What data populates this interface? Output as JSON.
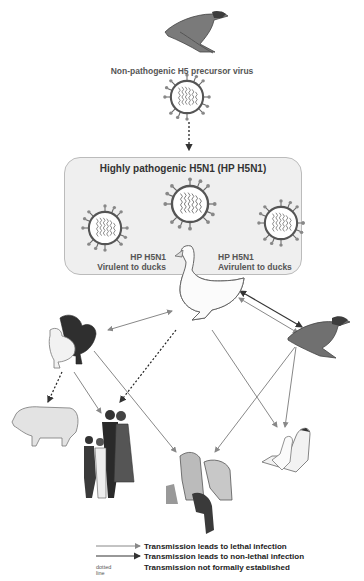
{
  "diagram": {
    "top_label": "Non-pathogenic H5 precursor virus",
    "box_title": "Highly pathogenic H5N1 (HP H5N1)",
    "virus_left": {
      "line1": "HP H5N1",
      "line2": "Virulent to ducks"
    },
    "virus_right": {
      "line1": "HP H5N1",
      "line2": "Avirulent to ducks"
    },
    "nodes": [
      {
        "id": "wild-duck-top",
        "name": "Wild duck (mallard)"
      },
      {
        "id": "precursor-virus",
        "name": "Non-pathogenic H5 precursor virus"
      },
      {
        "id": "hp-virus-center",
        "name": "HP H5N1 virus"
      },
      {
        "id": "hp-virus-left",
        "name": "HP H5N1 virulent to ducks"
      },
      {
        "id": "hp-virus-right",
        "name": "HP H5N1 avirulent to ducks"
      },
      {
        "id": "domestic-duck",
        "name": "Domestic duck"
      },
      {
        "id": "chickens",
        "name": "Chickens"
      },
      {
        "id": "wild-duck-right",
        "name": "Wild duck (mallard)"
      },
      {
        "id": "pig",
        "name": "Pig"
      },
      {
        "id": "humans",
        "name": "Human family"
      },
      {
        "id": "felines-ferret",
        "name": "Tigers, leopard, cat, ferret"
      },
      {
        "id": "geese",
        "name": "Geese"
      }
    ],
    "edges": [
      {
        "from": "precursor-virus",
        "to": "hp-virus-center",
        "type": "dotted"
      },
      {
        "from": "domestic-duck",
        "to": "chickens",
        "type": "lethal",
        "bidirectional": true
      },
      {
        "from": "domestic-duck",
        "to": "wild-duck-right",
        "type": "non-lethal",
        "bidirectional": true
      },
      {
        "from": "domestic-duck",
        "to": "wild-duck-right",
        "type": "lethal",
        "bidirectional": true
      },
      {
        "from": "domestic-duck",
        "to": "humans",
        "type": "dotted"
      },
      {
        "from": "domestic-duck",
        "to": "geese",
        "type": "lethal"
      },
      {
        "from": "chickens",
        "to": "pig",
        "type": "dotted"
      },
      {
        "from": "chickens",
        "to": "humans",
        "type": "lethal"
      },
      {
        "from": "chickens",
        "to": "felines-ferret",
        "type": "lethal"
      },
      {
        "from": "wild-duck-right",
        "to": "felines-ferret",
        "type": "lethal"
      },
      {
        "from": "wild-duck-right",
        "to": "geese",
        "type": "lethal"
      }
    ]
  },
  "legend": {
    "items": [
      {
        "style": "thin-gray-arrow",
        "text": "Transmission leads to lethal infection"
      },
      {
        "style": "dark-arrow",
        "text": "Transmission leads to non-lethal infection"
      },
      {
        "style": "dotted",
        "marker": "dotted line",
        "text": "Transmission not formally established"
      }
    ]
  },
  "colors": {
    "lethal": "#8a8a8a",
    "non_lethal": "#333333",
    "dotted": "#222222",
    "box_fill": "#efefef",
    "box_border": "#bbbbbb"
  }
}
